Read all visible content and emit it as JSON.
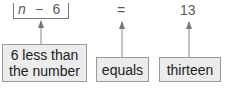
{
  "expression": {
    "variable": "n",
    "operator": "−",
    "constant": "6",
    "equals": "=",
    "result": "13"
  },
  "labels": [
    {
      "line1": "6 less than",
      "line2": "the number"
    },
    {
      "text": "equals"
    },
    {
      "text": "thirteen"
    }
  ],
  "colors": {
    "box_fill": "#ececec",
    "box_border": "#9a9a9a",
    "arrow": "#777777",
    "text": "#222222"
  }
}
